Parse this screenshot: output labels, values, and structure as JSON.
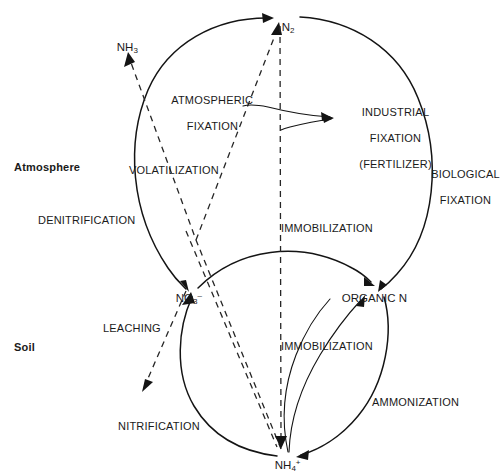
{
  "figure": {
    "type": "diagram",
    "background_color": "#ffffff",
    "line_color": "#141414"
  },
  "zones": {
    "atmosphere_label": "Atmosphere",
    "soil_label": "Soil"
  },
  "species": {
    "n2": {
      "formula": "N",
      "sub": "2",
      "sup": ""
    },
    "nh3": {
      "formula": "NH",
      "sub": "3",
      "sup": ""
    },
    "no3": {
      "formula": "NO",
      "sub": "3",
      "sup": "–"
    },
    "nh4": {
      "formula": "NH",
      "sub": "4",
      "sup": "+"
    },
    "organic_n": {
      "formula": "ORGANIC N",
      "sub": "",
      "sup": ""
    }
  },
  "processes": {
    "atmospheric_fixation": {
      "line1": "ATMOSPHERIC",
      "line2": "FIXATION"
    },
    "industrial_fixation": {
      "line1": "INDUSTRIAL",
      "line2": "FIXATION",
      "line3": "(FERTILIZER)"
    },
    "biological_fixation": {
      "line1": "BIOLOGICAL",
      "line2": "FIXATION"
    },
    "volatilization": {
      "label": "VOLATILIZATION"
    },
    "denitrification": {
      "label": "DENITRIFICATION"
    },
    "immobilization_upper": {
      "label": "IMMOBILIZATION"
    },
    "immobilization_lower": {
      "label": "IMMOBILIZATION"
    },
    "leaching": {
      "label": "LEACHING"
    },
    "nitrification": {
      "label": "NITRIFICATION"
    },
    "ammonization": {
      "label": "AMMONIZATION"
    }
  }
}
